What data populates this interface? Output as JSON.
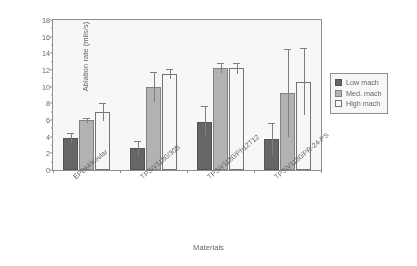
{
  "chart_data": {
    "type": "bar",
    "title": "",
    "xlabel": "Materials",
    "ylabel": "Ablation rate (mils/s)",
    "categories": [
      "EPDM/Kevlar",
      "TPSiV1180/30B",
      "TPSiV1180/Ph12T12",
      "TPSiV1180/PR-24-PS"
    ],
    "series": [
      {
        "name": "Low mach",
        "color": "#5f5f5f",
        "values": [
          3.8,
          2.6,
          5.8,
          3.7
        ],
        "errors": [
          0.6,
          0.9,
          1.9,
          1.9
        ]
      },
      {
        "name": "Med. mach",
        "color": "#b3b3b3",
        "values": [
          6.0,
          10.0,
          12.3,
          9.2
        ],
        "errors": [
          0.3,
          1.8,
          0.6,
          5.3
        ]
      },
      {
        "name": "High mach",
        "color": "#ffffff",
        "values": [
          7.0,
          11.5,
          12.2,
          10.6
        ],
        "errors": [
          1.1,
          0.6,
          0.7,
          4.0
        ]
      }
    ],
    "ylim": [
      0,
      18
    ],
    "ytick_values": [
      0,
      2,
      4,
      6,
      8,
      10,
      14,
      12,
      16,
      18
    ],
    "ytick_labels": [
      "0",
      "2",
      "4",
      "6",
      "8",
      "10",
      "14",
      "12",
      "16",
      "18"
    ],
    "yminor_step": 1,
    "grid": false,
    "legend_position": "right",
    "note": "y-axis tick labels at 12 and 14 appear swapped in the source figure"
  },
  "legend": {
    "items": [
      {
        "label": "Low mach",
        "style": "low"
      },
      {
        "label": "Med. mach",
        "style": "med"
      },
      {
        "label": "High mach",
        "style": "high"
      }
    ]
  }
}
